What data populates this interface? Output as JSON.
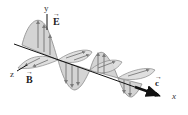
{
  "figure": {
    "axes": {
      "y_label": "y",
      "z_label": "z",
      "x_label": "x"
    },
    "vectors": {
      "electric": "E",
      "magnetic": "B",
      "velocity": "c"
    },
    "colors": {
      "lobe_fill": "#d4d4d4",
      "lobe_stroke": "#8a8a8a",
      "arrow": "#7a7a7a",
      "axis": "#111111"
    }
  }
}
